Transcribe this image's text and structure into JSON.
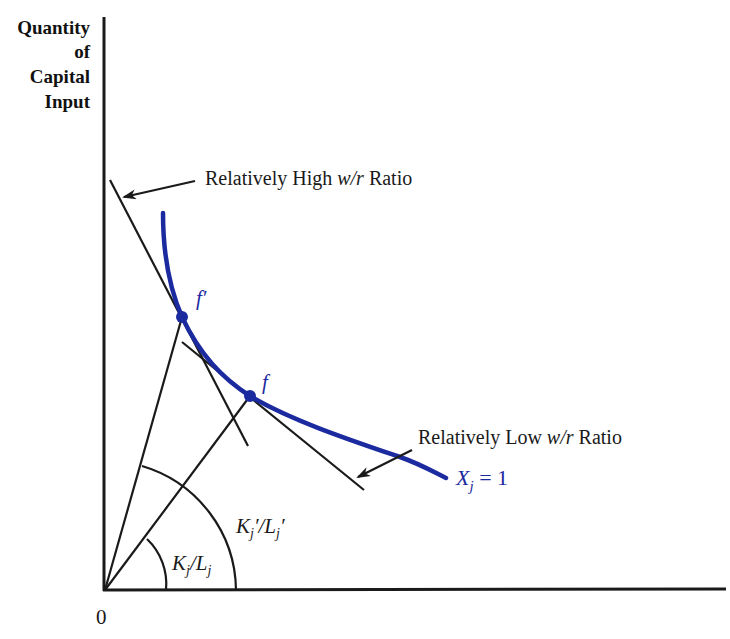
{
  "diagram": {
    "y_axis_label": [
      "Quantity",
      "of",
      "Capital",
      "Input"
    ],
    "origin_label": "0",
    "isoquant": {
      "label_var": "X",
      "label_sub": "j",
      "label_rest": " = 1",
      "color": "#1c2aa0"
    },
    "points": {
      "f_prime": "f′",
      "f": "f"
    },
    "annotations": {
      "high_ratio_prefix": "Relatively High ",
      "high_ratio_ital": "w/r",
      "high_ratio_suffix": " Ratio",
      "low_ratio_prefix": "Relatively Low ",
      "low_ratio_ital": "w/r",
      "low_ratio_suffix": " Ratio"
    },
    "angles": {
      "small_K": "K",
      "small_j1": "j",
      "small_slash": "/L",
      "small_j2": "j",
      "large_K": "K",
      "large_j1": "j",
      "large_mid": "′/L",
      "large_j2": "j",
      "large_prime": "′"
    },
    "colors": {
      "line": "#1a1a1a",
      "isoquant": "#1c2aa0"
    }
  }
}
